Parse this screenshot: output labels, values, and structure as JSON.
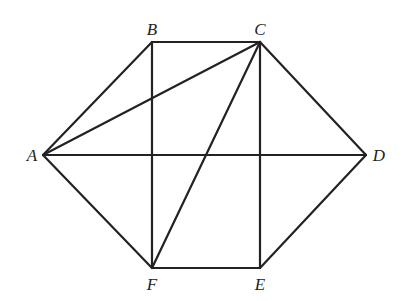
{
  "diagram": {
    "type": "geometry-hexagon",
    "points": {
      "A": {
        "label": "A",
        "x": 43,
        "y": 155,
        "lx": 32,
        "ly": 161
      },
      "B": {
        "label": "B",
        "x": 152,
        "y": 42,
        "lx": 152,
        "ly": 35
      },
      "C": {
        "label": "C",
        "x": 260,
        "y": 42,
        "lx": 260,
        "ly": 35
      },
      "D": {
        "label": "D",
        "x": 366,
        "y": 155,
        "lx": 379,
        "ly": 161
      },
      "E": {
        "label": "E",
        "x": 260,
        "y": 268,
        "lx": 260,
        "ly": 290
      },
      "F": {
        "label": "F",
        "x": 152,
        "y": 268,
        "lx": 152,
        "ly": 290
      }
    },
    "segments": [
      [
        "A",
        "B"
      ],
      [
        "B",
        "C"
      ],
      [
        "C",
        "D"
      ],
      [
        "D",
        "E"
      ],
      [
        "E",
        "F"
      ],
      [
        "F",
        "A"
      ],
      [
        "A",
        "C"
      ],
      [
        "A",
        "D"
      ],
      [
        "B",
        "F"
      ],
      [
        "C",
        "E"
      ],
      [
        "C",
        "F"
      ]
    ],
    "stroke_color": "#222222"
  }
}
